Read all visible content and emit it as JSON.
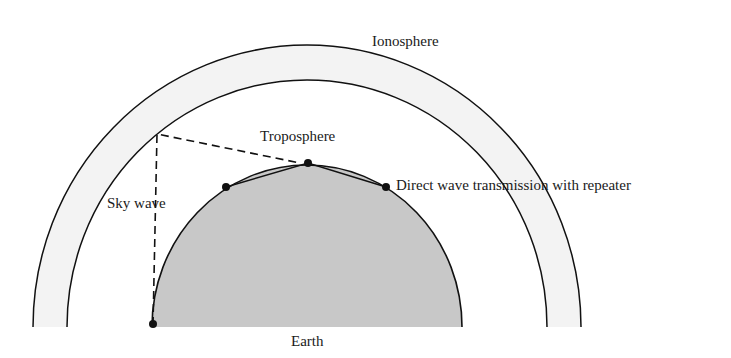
{
  "diagram": {
    "labels": {
      "ionosphere": "Ionosphere",
      "troposphere": "Troposphere",
      "sky_wave": "Sky wave",
      "direct_wave": "Direct wave transmission with repeater",
      "earth": "Earth"
    },
    "colors": {
      "earth_fill": "#c8c8c8",
      "ionosphere_band_fill": "#f3f3f3",
      "line": "#111111"
    }
  }
}
